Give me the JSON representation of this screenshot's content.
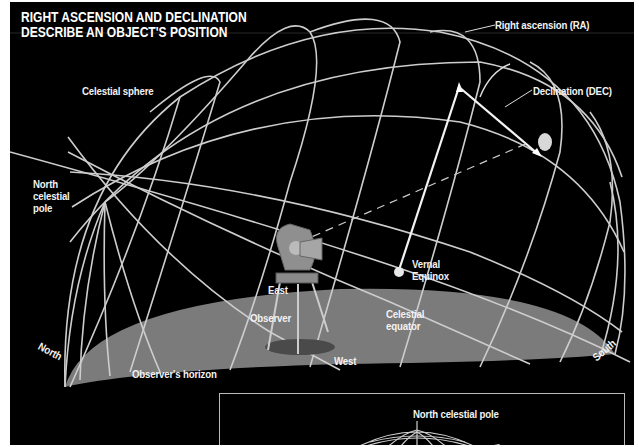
{
  "title": {
    "line1": "RIGHT ASCENSION AND DECLINATION",
    "line2": "DESCRIBE  AN OBJECT'S POSITION"
  },
  "labels": {
    "celestial_sphere": "Celestial sphere",
    "right_ascension": "Right ascension (RA)",
    "declination": "Declination (DEC)",
    "north_celestial_pole": [
      "North",
      "celestial",
      "pole"
    ],
    "vernal_equinox": [
      "Vernal",
      "Equinox"
    ],
    "east": "East",
    "observer": "Observer",
    "celestial_equator": [
      "Celestial",
      "equator"
    ],
    "west": "West",
    "north": "North",
    "south": "South",
    "observers_horizon": "Observer's horizon"
  },
  "inset": {
    "label": "North celestial pole"
  },
  "colors": {
    "background": "#000000",
    "grid_lines": "#cfcfcf",
    "horizon_plane": "#7a7a7a",
    "text": "#f2f2f2"
  }
}
